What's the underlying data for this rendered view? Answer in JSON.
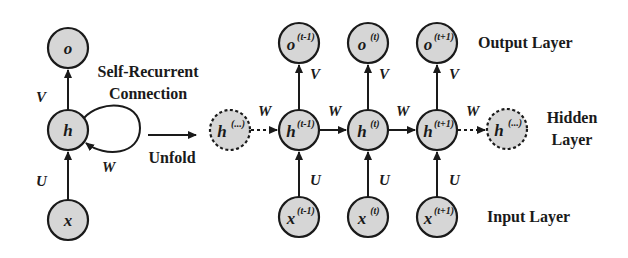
{
  "diagram": {
    "colors": {
      "node_fill": "#d6d6d6",
      "stroke": "#1a1a1a",
      "background": "#ffffff"
    },
    "folded": {
      "output": {
        "base": "o",
        "sup": ""
      },
      "hidden": {
        "base": "h",
        "sup": ""
      },
      "input": {
        "base": "x",
        "sup": ""
      },
      "weights": {
        "V": "V",
        "U": "U",
        "W": "W"
      },
      "self_recurrent_label_line1": "Self-Recurrent",
      "self_recurrent_label_line2": "Connection"
    },
    "unfold_label": "Unfold",
    "unfolded": {
      "hidden_prev": {
        "base": "h",
        "sup": "(...)"
      },
      "hidden_next": {
        "base": "h",
        "sup": "(...)"
      },
      "steps": [
        {
          "output": {
            "base": "o",
            "sup": "(t-1)"
          },
          "hidden": {
            "base": "h",
            "sup": "(t-1)"
          },
          "input": {
            "base": "x",
            "sup": "(t-1)"
          },
          "V": "V",
          "U": "U",
          "W_in": "W"
        },
        {
          "output": {
            "base": "o",
            "sup": "(t)"
          },
          "hidden": {
            "base": "h",
            "sup": "(t)"
          },
          "input": {
            "base": "x",
            "sup": "(t)"
          },
          "V": "V",
          "U": "U",
          "W_in": "W"
        },
        {
          "output": {
            "base": "o",
            "sup": "(t+1)"
          },
          "hidden": {
            "base": "h",
            "sup": "(t+1)"
          },
          "input": {
            "base": "x",
            "sup": "(t+1)"
          },
          "V": "V",
          "U": "U",
          "W_in": "W"
        }
      ],
      "W_out": "W"
    },
    "layer_labels": {
      "output": "Output Layer",
      "hidden_line1": "Hidden",
      "hidden_line2": "Layer",
      "input": "Input Layer"
    }
  }
}
